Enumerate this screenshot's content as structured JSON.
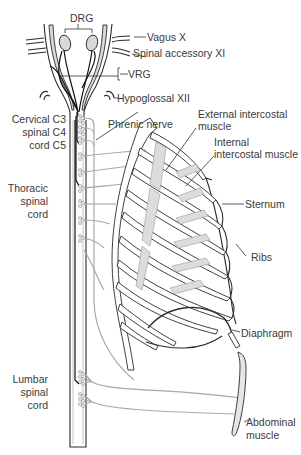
{
  "diagram": {
    "labels": {
      "drg": "DRG",
      "vagus": "Vagus X",
      "spinal_accessory": "Spinal accessory XI",
      "vrg": "VRG",
      "hypoglossal": "Hypoglossal XII",
      "cervical_line1": "Cervical  C3",
      "cervical_line2": "spinal  C4",
      "cervical_line3": "cord  C5",
      "phrenic": "Phrenic nerve",
      "external_intercostal_1": "External intercostal",
      "external_intercostal_2": "muscle",
      "internal_intercostal_1": "Internal",
      "internal_intercostal_2": "intercostal muscle",
      "thoracic_1": "Thoracic",
      "thoracic_2": "spinal",
      "thoracic_3": "cord",
      "sternum": "Sternum",
      "ribs": "Ribs",
      "diaphragm": "Diaphragm",
      "lumbar_1": "Lumbar",
      "lumbar_2": "spinal",
      "lumbar_3": "cord",
      "abdominal_1": "Abdominal",
      "abdominal_2": "muscle"
    },
    "colors": {
      "outline": "#2b2b2b",
      "muscle_fill": "#d9d9d9",
      "nerve": "#a8a8a8",
      "text": "#3a3a3a"
    }
  }
}
